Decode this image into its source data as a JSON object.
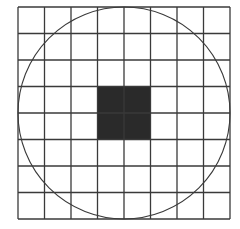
{
  "diagram": {
    "type": "grid-with-inscribed-circle",
    "grid": {
      "rows": 8,
      "cols": 8,
      "origin": [
        18,
        7
      ],
      "cell_size": 26.5,
      "line_color": "#3a3a3a",
      "line_width": 1.3
    },
    "circle": {
      "inscribed": true,
      "stroke_color": "#3a3a3a",
      "stroke_width": 1.1
    },
    "shaded_square": {
      "col_start": 3,
      "row_start": 3,
      "cols": 2,
      "rows": 2,
      "fill_color": "#2a2a2a"
    },
    "background_color": "#ffffff"
  }
}
